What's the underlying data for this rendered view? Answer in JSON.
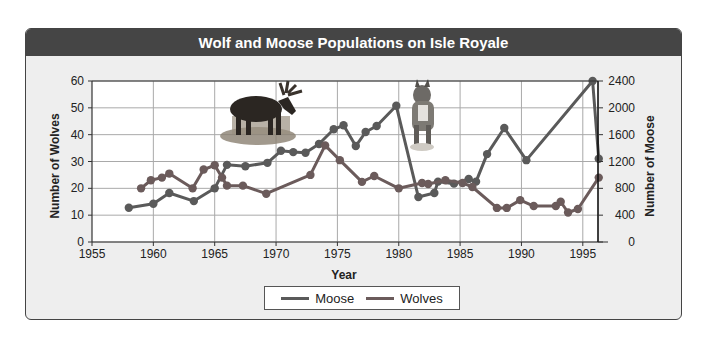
{
  "title": "Wolf and  Moose Populations on Isle Royale",
  "legend": {
    "moose_label": "Moose",
    "wolves_label": "Wolves"
  },
  "colors": {
    "moose": "#5a5a5a",
    "wolves": "#6b5b5b",
    "header_bg": "#454545",
    "panel_bg": "#eeeeee"
  },
  "images": [
    "moose-photo",
    "wolf-photo"
  ],
  "chart_data": {
    "type": "line",
    "title": "Wolf and  Moose Populations on Isle Royale",
    "xlabel": "Year",
    "ylabel": "Number of Wolves",
    "y2label": "Number of Moose",
    "xlim": [
      1955,
      1996.3
    ],
    "ylim": [
      0,
      60
    ],
    "y2lim": [
      0,
      2400
    ],
    "xticks": [
      1955,
      1960,
      1965,
      1970,
      1975,
      1980,
      1985,
      1990,
      1995
    ],
    "yticks": [
      0,
      10,
      20,
      30,
      40,
      50,
      60
    ],
    "y2ticks": [
      0,
      400,
      800,
      1200,
      1600,
      2000,
      2400
    ],
    "grid": true,
    "legend_position": "bottom",
    "series": [
      {
        "name": "Moose",
        "axis": "right",
        "x": [
          1958,
          1960,
          1961.3,
          1963.3,
          1965,
          1966,
          1967.5,
          1969.3,
          1970.4,
          1971.4,
          1972.4,
          1973.5,
          1974.7,
          1975.5,
          1976.5,
          1977.3,
          1978.2,
          1979.8,
          1981.6,
          1982.9,
          1983.2,
          1984.5,
          1985.7,
          1986.3,
          1987.2,
          1988.6,
          1990.4,
          1995.8,
          1996.3
        ],
        "values": [
          510,
          570,
          730,
          610,
          800,
          1150,
          1130,
          1180,
          1360,
          1340,
          1330,
          1460,
          1680,
          1740,
          1430,
          1640,
          1730,
          2030,
          670,
          730,
          900,
          870,
          940,
          900,
          1310,
          1700,
          1220,
          2400,
          1240
        ]
      },
      {
        "name": "Wolves",
        "axis": "left",
        "x": [
          1959,
          1959.8,
          1960.7,
          1961.3,
          1963.2,
          1964.1,
          1965,
          1965.6,
          1966,
          1967.3,
          1969.2,
          1972.8,
          1974,
          1975.2,
          1977,
          1978,
          1980,
          1981.9,
          1982.4,
          1983.8,
          1985.2,
          1986,
          1988,
          1988.8,
          1989.9,
          1991,
          1992.8,
          1993.2,
          1993.8,
          1994.6,
          1996.3
        ],
        "values": [
          20,
          23,
          24,
          25.5,
          20,
          27,
          28.6,
          24,
          21,
          21,
          18,
          25,
          36,
          30.5,
          22.4,
          24.6,
          20,
          22,
          21.6,
          23,
          22,
          20.5,
          12.7,
          12.7,
          15.6,
          13.4,
          13.4,
          15,
          11,
          12.3,
          24
        ]
      }
    ]
  }
}
